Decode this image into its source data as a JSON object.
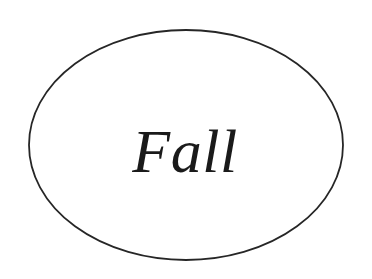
{
  "figure": {
    "background_color": "#ffffff",
    "shape": {
      "name": "ellipse",
      "stroke_color": "#262626",
      "fill_color": "#ffffff",
      "stroke_width": 1.8,
      "center_x": 186,
      "center_y": 145,
      "radius_x": 157,
      "radius_y": 115
    },
    "label": {
      "text": "Fall",
      "color": "#1a1a1a",
      "style": "italic serif",
      "font_size": 62,
      "center_x": 185,
      "baseline_y": 172
    }
  }
}
